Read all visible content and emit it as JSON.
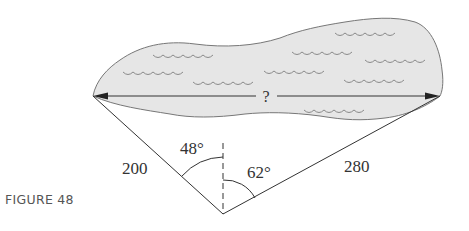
{
  "figure": {
    "caption": "FIGURE 48",
    "unknown_label": "?",
    "sides": {
      "left": {
        "label": "200",
        "value": 200
      },
      "right": {
        "label": "280",
        "value": 280
      }
    },
    "angles": {
      "left": {
        "label": "48°",
        "value": 48
      },
      "right": {
        "label": "62°",
        "value": 62
      }
    },
    "colors": {
      "lake_fill": "#e6e6e6",
      "lake_stroke": "#777777",
      "wave_stroke": "#8a8a8a",
      "line": "#333333",
      "text": "#333333",
      "caption": "#555555"
    }
  }
}
